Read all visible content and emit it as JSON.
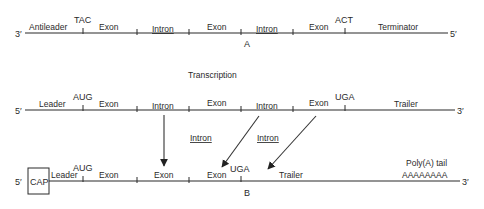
{
  "diagram": {
    "strand_a": {
      "label": "A",
      "left_end": "3′",
      "right_end": "5′",
      "segments": [
        "Antileader",
        "Exon",
        "Intron",
        "Exon",
        "Intron",
        "Exon",
        "Terminator"
      ],
      "codons": {
        "start": "TAC",
        "stop": "ACT"
      }
    },
    "process_label": "Transcription",
    "strand_transcript": {
      "left_end": "5′",
      "right_end": "3′",
      "segments": [
        "Leader",
        "Exon",
        "Intron",
        "Exon",
        "Intron",
        "Exon",
        "Trailer"
      ],
      "codons": {
        "start": "AUG",
        "stop": "UGA"
      }
    },
    "removed_introns": [
      "Intron",
      "Intron"
    ],
    "strand_b": {
      "label": "B",
      "left_end": "5′",
      "right_end": "3′",
      "cap": "CAP",
      "segments": [
        "Leader",
        "Exon",
        "Exon",
        "Exon",
        "Trailer"
      ],
      "codons": {
        "start": "AUG",
        "stop": "UGA"
      },
      "poly_a_label": "Poly(A) tail",
      "poly_a_seq": "AAAAAAAA"
    }
  }
}
